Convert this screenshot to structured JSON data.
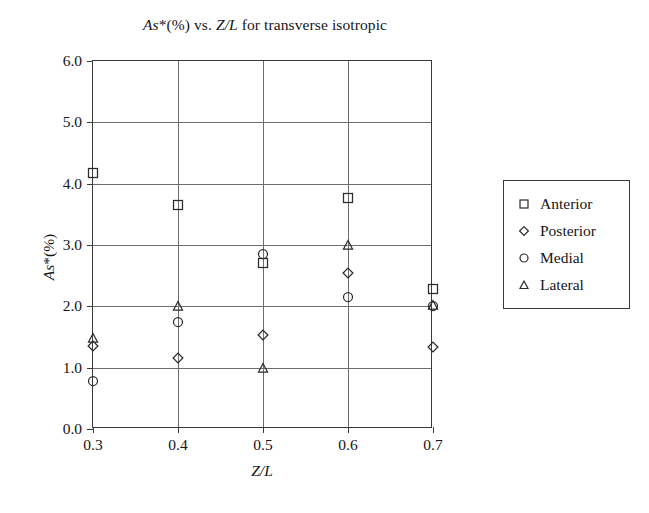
{
  "chart_data": {
    "type": "scatter",
    "title": "As*(%) vs. Z/L for transverse isotropic",
    "title_parts": {
      "italic_1": "As",
      "upright_1": "*(%) vs. ",
      "italic_2": "Z/L",
      "upright_2": " for transverse isotropic"
    },
    "xlabel": "Z/L",
    "ylabel": "As*(%)",
    "ylabel_parts": {
      "italic": "As",
      "upright": "*(%)"
    },
    "x": [
      0.3,
      0.4,
      0.5,
      0.6,
      0.7
    ],
    "xlim": [
      0.3,
      0.7
    ],
    "ylim": [
      0.0,
      6.0
    ],
    "xticks": [
      "0.3",
      "0.4",
      "0.5",
      "0.6",
      "0.7"
    ],
    "yticks": [
      "0.0",
      "1.0",
      "2.0",
      "3.0",
      "4.0",
      "5.0",
      "6.0"
    ],
    "xtick_values": [
      0.3,
      0.4,
      0.5,
      0.6,
      0.7
    ],
    "ytick_values": [
      0.0,
      1.0,
      2.0,
      3.0,
      4.0,
      5.0,
      6.0
    ],
    "grid": true,
    "legend_position": "right",
    "series": [
      {
        "name": "Anterior",
        "marker": "square",
        "values": [
          4.17,
          3.65,
          2.7,
          3.77,
          2.28
        ]
      },
      {
        "name": "Posterior",
        "marker": "diamond",
        "values": [
          1.35,
          1.15,
          1.53,
          2.55,
          1.33
        ]
      },
      {
        "name": "Medial",
        "marker": "circle",
        "values": [
          0.78,
          1.75,
          2.85,
          2.15,
          2.0
        ]
      },
      {
        "name": "Lateral",
        "marker": "triangle",
        "values": [
          1.48,
          2.0,
          1.0,
          3.0,
          2.02
        ]
      }
    ]
  },
  "colors": {
    "marker_stroke": "#2b2b2b",
    "axis": "#3a3a3a",
    "grid": "#6d6d6d",
    "text": "#151515",
    "background": "#ffffff"
  }
}
